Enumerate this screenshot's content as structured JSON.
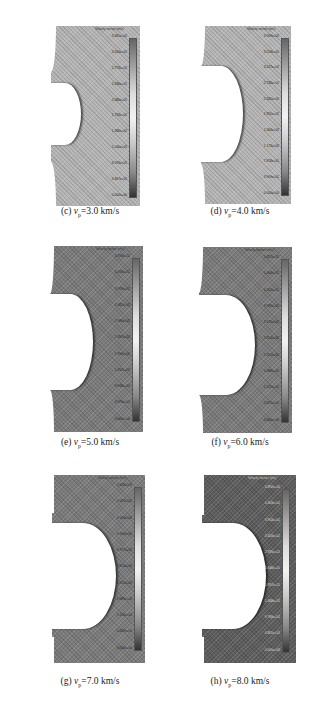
{
  "figure": {
    "panels": [
      {
        "id": "c",
        "label_prefix": "(c) ",
        "var": "v",
        "sub": "p",
        "value_text": "=3.0 km/s",
        "colorbar_title": "Velocity vectors (m/s)",
        "ticks": [
          "3.461e+02",
          "3.100e+02",
          "2.773e+02",
          "2.436e+02",
          "2.080e+02",
          "1.733e+02",
          "1.386e+02",
          "1.040e+02",
          "6.933e+01",
          "3.467e+01",
          "0.000e+00"
        ]
      },
      {
        "id": "d",
        "label_prefix": "(d) ",
        "var": "v",
        "sub": "p",
        "value_text": "=4.0 km/s",
        "colorbar_title": "Velocity vectors (m/s)",
        "ticks": [
          "3.909e+02",
          "3.518e+02",
          "3.127e+02",
          "2.736e+02",
          "2.345e+02",
          "1.955e+02",
          "1.564e+02",
          "1.173e+02",
          "7.818e+01",
          "3.909e+01",
          "0.000e+00"
        ]
      },
      {
        "id": "e",
        "label_prefix": "(e) ",
        "var": "v",
        "sub": "p",
        "value_text": "=5.0 km/s",
        "colorbar_title": "Velocity vectors (m/s)",
        "ticks": [
          "4.974e+02",
          "4.476e+02",
          "3.979e+02",
          "3.482e+02",
          "2.984e+02",
          "2.487e+02",
          "1.990e+02",
          "1.492e+02",
          "9.948e+01",
          "4.974e+01",
          "0.000e+00"
        ]
      },
      {
        "id": "f",
        "label_prefix": "(f) ",
        "var": "v",
        "sub": "p",
        "value_text": "=6.0 km/s",
        "colorbar_title": "Velocity vectors (m/s)",
        "ticks": [
          "5.627e+02",
          "5.064e+02",
          "4.502e+02",
          "3.939e+02",
          "3.376e+02",
          "2.814e+02",
          "2.251e+02",
          "1.688e+02",
          "1.125e+02",
          "5.627e+01",
          "0.000e+00"
        ]
      },
      {
        "id": "g",
        "label_prefix": "(g) ",
        "var": "v",
        "sub": "p",
        "value_text": "=7.0 km/s",
        "colorbar_title": "Velocity vectors (m/s)",
        "ticks": [
          "5.629e+02",
          "5.067e+02",
          "4.503e+02",
          "3.940e+02",
          "3.377e+02",
          "2.814e+02",
          "2.252e+02",
          "1.689e+02",
          "1.126e+02",
          "5.629e+01",
          "0.000e+00"
        ]
      },
      {
        "id": "h",
        "label_prefix": "(h) ",
        "var": "v",
        "sub": "p",
        "value_text": "=8.0 km/s",
        "colorbar_title": "Velocity vectors (m/s)",
        "ticks": [
          "4.892e+02",
          "4.403e+02",
          "3.914e+02",
          "3.424e+02",
          "2.935e+02",
          "2.446e+02",
          "1.957e+02",
          "1.468e+02",
          "9.784e+01",
          "4.892e+01",
          "0.000e+00"
        ]
      }
    ]
  }
}
